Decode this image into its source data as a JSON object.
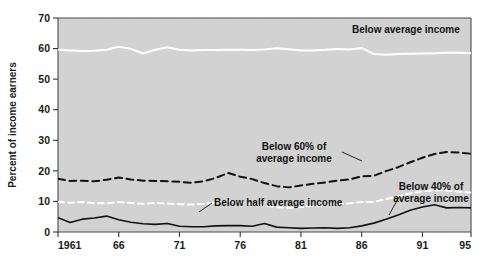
{
  "figure": {
    "background": "#ffffff",
    "plot_background": "#d2d2d2",
    "frame_color": "#4a4a4a"
  },
  "chart_data": {
    "type": "line",
    "title": "",
    "subtitle": "",
    "xlabel": "",
    "ylabel": "Percent of income earners",
    "xlim": [
      1961,
      1995
    ],
    "ylim": [
      0,
      70
    ],
    "grid": false,
    "legend_position": "inline-annotations",
    "xticks": [
      1961,
      1966,
      1971,
      1976,
      1981,
      1986,
      1991,
      1995
    ],
    "xticklabels": [
      "1961",
      "66",
      "71",
      "76",
      "81",
      "86",
      "91",
      "95"
    ],
    "yticks": [
      0,
      10,
      20,
      30,
      40,
      50,
      60,
      70
    ],
    "yticklabels": [
      "0",
      "10",
      "20",
      "30",
      "40",
      "50",
      "60",
      "70"
    ],
    "x": [
      1961,
      1962,
      1963,
      1964,
      1965,
      1966,
      1967,
      1968,
      1969,
      1970,
      1971,
      1972,
      1973,
      1974,
      1975,
      1976,
      1977,
      1978,
      1979,
      1980,
      1981,
      1982,
      1983,
      1984,
      1985,
      1986,
      1987,
      1988,
      1989,
      1990,
      1991,
      1992,
      1993,
      1994,
      1995
    ],
    "series": [
      {
        "name": "Below average income",
        "label": "Below average income",
        "style": "solid",
        "color": "#ffffff",
        "width": 2.0,
        "values": [
          59.6,
          59.4,
          59.2,
          59.3,
          59.6,
          60.6,
          59.9,
          58.4,
          59.6,
          60.4,
          59.6,
          59.4,
          59.5,
          59.5,
          59.6,
          59.6,
          59.5,
          59.7,
          60.1,
          59.8,
          59.4,
          59.4,
          59.6,
          59.9,
          59.7,
          60.2,
          58.2,
          58.0,
          58.2,
          58.3,
          58.4,
          58.5,
          58.6,
          58.6,
          58.5
        ]
      },
      {
        "name": "Below 60% of average income",
        "label": "Below 60% of\naverage income",
        "style": "dashed",
        "color": "#111111",
        "width": 2.0,
        "values": [
          17.4,
          16.7,
          16.8,
          16.6,
          17.1,
          17.8,
          17.2,
          16.8,
          16.7,
          16.6,
          16.4,
          16.1,
          16.6,
          17.7,
          19.3,
          18.1,
          17.3,
          16.0,
          15.0,
          14.6,
          15.2,
          15.8,
          16.2,
          16.8,
          17.2,
          18.2,
          18.4,
          19.9,
          21.2,
          22.8,
          24.3,
          25.5,
          26.2,
          26.0,
          25.6
        ]
      },
      {
        "name": "Below half average income",
        "label": "Below half average income",
        "style": "dashed",
        "color": "#ffffff",
        "width": 2.0,
        "values": [
          9.9,
          9.6,
          9.8,
          9.4,
          9.4,
          9.8,
          9.5,
          9.2,
          9.5,
          9.3,
          9.1,
          9.0,
          9.2,
          9.7,
          10.2,
          9.7,
          9.0,
          8.7,
          8.1,
          7.9,
          8.2,
          8.6,
          8.9,
          9.2,
          9.4,
          9.8,
          9.8,
          10.8,
          11.6,
          12.6,
          13.3,
          13.7,
          13.6,
          13.2,
          12.9
        ]
      },
      {
        "name": "Below 40% of average income",
        "label": "Below 40% of\naverage income",
        "style": "solid",
        "color": "#111111",
        "width": 1.6,
        "values": [
          4.7,
          3.1,
          4.2,
          4.6,
          5.2,
          4.0,
          3.2,
          2.7,
          2.5,
          2.8,
          1.9,
          1.7,
          1.7,
          2.0,
          2.1,
          2.1,
          1.9,
          2.8,
          1.6,
          1.4,
          1.2,
          1.3,
          1.4,
          1.2,
          1.4,
          2.0,
          2.9,
          4.2,
          5.6,
          7.1,
          8.2,
          8.9,
          7.9,
          8.0,
          7.9
        ]
      }
    ],
    "annotations": [
      {
        "name": "below-average-income",
        "text": "Below average income",
        "x": 352,
        "y": 33,
        "align": "left",
        "leader": null
      },
      {
        "name": "below-60pct",
        "text_line1": "Below 60% of",
        "text_line2": "average income",
        "x": 294,
        "y": 150,
        "align": "middle",
        "leader": {
          "x1": 342,
          "y1": 152,
          "x2": 362,
          "y2": 161
        }
      },
      {
        "name": "below-half-average",
        "text": "Below half average income",
        "x": 214,
        "y": 206,
        "align": "left",
        "leader": {
          "x1": 212,
          "y1": 203,
          "x2": 199,
          "y2": 212
        }
      },
      {
        "name": "below-40pct",
        "text_line1": "Below 40% of",
        "text_line2": "average income",
        "x": 431,
        "y": 190,
        "align": "middle",
        "leader": {
          "x1": 399,
          "y1": 197,
          "x2": 389,
          "y2": 215
        }
      }
    ]
  }
}
